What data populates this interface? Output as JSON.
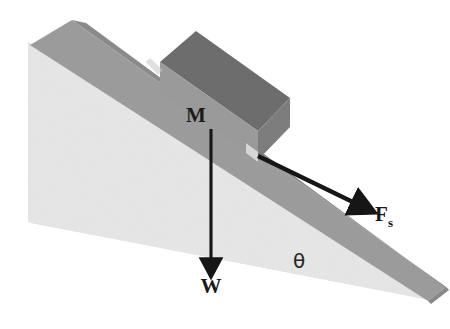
{
  "figure": {
    "kind": "inclined-plane-free-body-diagram",
    "background_color": "#ffffff"
  },
  "labels": {
    "mass": "M",
    "weight": "W",
    "friction_force": "F",
    "friction_force_subscript": "s",
    "angle": "θ"
  },
  "colors": {
    "wedge_front_face": "#e4e4e4",
    "wedge_front_face_shadow": "#dcdcdc",
    "ramp_top_surface": "#9d9d9d",
    "ramp_edge_strip": "#8f8f8f",
    "block_top_face": "#6e6e6e",
    "block_front_face": "#9a9a9a",
    "block_side_face": "#7c7c7c",
    "arrow_color": "#161616",
    "text_color": "#1a1a1a"
  },
  "geometry": {
    "wedge_apex": "top-left",
    "incline_direction": "down-to-the-right",
    "weight_arrow": "vertical downward from block",
    "friction_arrow": "down the slope to lower right",
    "angle_location": "between incline surface and horizontal base, lower right"
  }
}
